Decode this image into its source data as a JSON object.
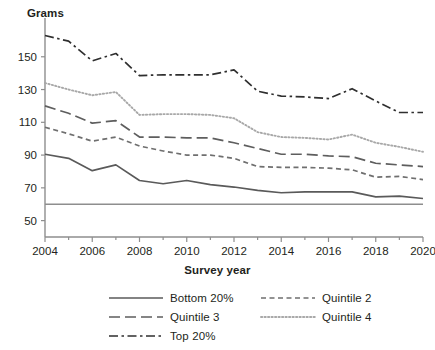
{
  "chart_data": {
    "type": "line",
    "title": "",
    "ylabel": "Grams",
    "xlabel": "Survey year",
    "ylim": [
      40,
      170
    ],
    "xlim": [
      2004,
      2020
    ],
    "yticks": [
      50,
      70,
      90,
      110,
      130,
      150
    ],
    "xticks": [
      2004,
      2006,
      2008,
      2010,
      2012,
      2014,
      2016,
      2018,
      2020
    ],
    "x": [
      2004,
      2005,
      2006,
      2007,
      2008,
      2009,
      2010,
      2011,
      2012,
      2013,
      2014,
      2015,
      2016,
      2017,
      2018,
      2019,
      2020
    ],
    "grid": false,
    "legend_position": "bottom",
    "reference_line": {
      "label": "",
      "value": 60,
      "color": "#8e8e8e",
      "style": "solid"
    },
    "series": [
      {
        "name": "Bottom 20%",
        "style": "solid",
        "color": "#5a5a5a",
        "values": [
          90.5,
          88.0,
          80.5,
          84.0,
          74.5,
          72.5,
          74.5,
          72.0,
          70.5,
          68.5,
          67.0,
          67.5,
          67.5,
          67.5,
          64.5,
          65.0,
          63.5
        ]
      },
      {
        "name": "Quintile 2",
        "style": "dashed-short",
        "color": "#6f6f6f",
        "values": [
          107.0,
          103.0,
          98.5,
          101.0,
          95.5,
          92.5,
          90.0,
          90.0,
          88.0,
          83.0,
          82.5,
          82.5,
          82.0,
          81.0,
          76.5,
          77.0,
          75.0
        ]
      },
      {
        "name": "Quintile 3",
        "style": "dashed-long",
        "color": "#5e5e5e",
        "values": [
          120.0,
          115.5,
          109.5,
          111.0,
          101.0,
          101.0,
          100.5,
          100.5,
          97.5,
          94.0,
          90.5,
          90.5,
          89.5,
          89.0,
          85.0,
          84.0,
          83.0
        ]
      },
      {
        "name": "Quintile 4",
        "style": "dotted",
        "color": "#a8a8a8",
        "values": [
          134.0,
          130.0,
          126.5,
          128.5,
          114.5,
          115.0,
          115.0,
          114.5,
          112.5,
          104.0,
          101.0,
          100.5,
          99.5,
          102.5,
          97.5,
          95.0,
          92.0
        ]
      },
      {
        "name": "Top 20%",
        "style": "dash-dot",
        "color": "#2f2f2f",
        "values": [
          163.0,
          159.5,
          147.5,
          152.0,
          138.5,
          139.0,
          139.0,
          139.0,
          142.0,
          129.0,
          126.0,
          125.5,
          124.5,
          130.5,
          123.0,
          116.0,
          116.0
        ]
      }
    ]
  },
  "legend": {
    "entries": [
      {
        "label": "Bottom 20%"
      },
      {
        "label": "Quintile 2"
      },
      {
        "label": "Quintile 3"
      },
      {
        "label": "Quintile 4"
      },
      {
        "label": "Top 20%"
      }
    ]
  }
}
